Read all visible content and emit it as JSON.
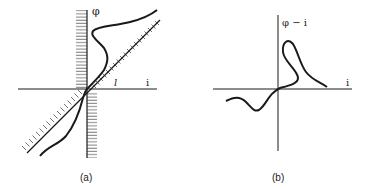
{
  "panel_a": {
    "y_label": "φ",
    "x_label": "i",
    "line_label": "l",
    "caption": "(a)"
  },
  "panel_b": {
    "y_label": "φ − i",
    "x_label": "i",
    "caption": "(b)"
  },
  "colors": {
    "ink": "#1a1a1a",
    "background": "#ffffff"
  }
}
